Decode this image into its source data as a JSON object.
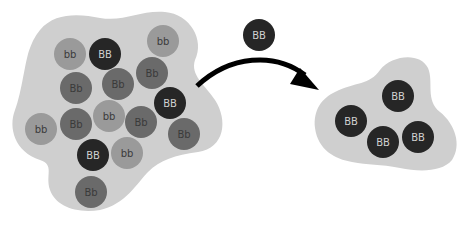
{
  "colors": {
    "background": "#ffffff",
    "blob": "#cfcfcf",
    "bb": "#9a9a9a",
    "Bb": "#6a6a6a",
    "BB": "#262626",
    "label_light": "#d0d0d0",
    "label_dark": "#3a3a3a",
    "arrow": "#000000"
  },
  "left_population": {
    "label": "mixed population",
    "circles": [
      {
        "genotype": "bb",
        "label": "bb",
        "x": 70,
        "y": 54
      },
      {
        "genotype": "BB",
        "label": "BB",
        "x": 105,
        "y": 54
      },
      {
        "genotype": "bb",
        "label": "bb",
        "x": 163,
        "y": 41
      },
      {
        "genotype": "Bb",
        "label": "Bb",
        "x": 76,
        "y": 88
      },
      {
        "genotype": "Bb",
        "label": "Bb",
        "x": 118,
        "y": 84
      },
      {
        "genotype": "Bb",
        "label": "Bb",
        "x": 152,
        "y": 73
      },
      {
        "genotype": "BB",
        "label": "BB",
        "x": 170,
        "y": 103
      },
      {
        "genotype": "bb",
        "label": "bb",
        "x": 109,
        "y": 116
      },
      {
        "genotype": "Bb",
        "label": "Bb",
        "x": 76,
        "y": 124
      },
      {
        "genotype": "Bb",
        "label": "Bb",
        "x": 141,
        "y": 122
      },
      {
        "genotype": "bb",
        "label": "bb",
        "x": 41,
        "y": 129
      },
      {
        "genotype": "Bb",
        "label": "Bb",
        "x": 184,
        "y": 134
      },
      {
        "genotype": "BB",
        "label": "BB",
        "x": 93,
        "y": 155
      },
      {
        "genotype": "bb",
        "label": "bb",
        "x": 127,
        "y": 153
      },
      {
        "genotype": "Bb",
        "label": "Bb",
        "x": 91,
        "y": 192
      }
    ]
  },
  "migrant": {
    "genotype": "BB",
    "label": "BB",
    "x": 259,
    "y": 35
  },
  "right_population": {
    "label": "founder population",
    "circles": [
      {
        "genotype": "BB",
        "label": "BB",
        "x": 398,
        "y": 96
      },
      {
        "genotype": "BB",
        "label": "BB",
        "x": 351,
        "y": 121
      },
      {
        "genotype": "BB",
        "label": "BB",
        "x": 383,
        "y": 142
      },
      {
        "genotype": "BB",
        "label": "BB",
        "x": 418,
        "y": 137
      }
    ]
  },
  "circle_radius": 16
}
